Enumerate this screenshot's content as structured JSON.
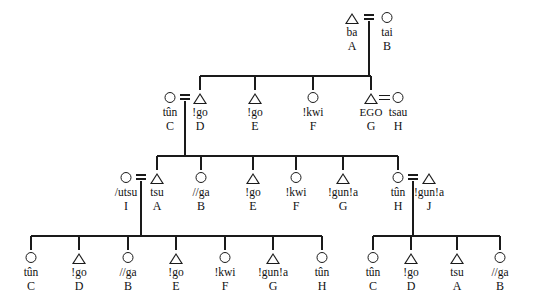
{
  "diagram": {
    "type": "kinship-genealogy",
    "symbols": {
      "male": "triangle",
      "female": "circle"
    },
    "line_color": "#1a1a1a",
    "background": "#ffffff"
  },
  "generations": [
    {
      "id": "gen-1",
      "y_symbol": 12,
      "y_term": 30,
      "y_id": 44,
      "persons": [
        {
          "key": "g1-ba",
          "sex": "male",
          "term": "ba",
          "id": "A",
          "x": 352
        },
        {
          "key": "g1-tai",
          "sex": "female",
          "term": "tai",
          "id": "B",
          "x": 387
        }
      ]
    },
    {
      "id": "gen-2",
      "y_symbol": 92,
      "y_term": 110,
      "y_id": 124,
      "persons": [
        {
          "key": "g2-tun",
          "sex": "female",
          "term": "tûn",
          "id": "C",
          "x": 170
        },
        {
          "key": "g2-go-d",
          "sex": "male",
          "term": "!go",
          "id": "D",
          "x": 200
        },
        {
          "key": "g2-go-e",
          "sex": "male",
          "term": "!go",
          "id": "E",
          "x": 255
        },
        {
          "key": "g2-kwi",
          "sex": "female",
          "term": "!kwi",
          "id": "F",
          "x": 313
        },
        {
          "key": "g2-ego",
          "sex": "male",
          "term": "EGO",
          "id": "G",
          "x": 371
        },
        {
          "key": "g2-tsau",
          "sex": "female",
          "term": "tsau",
          "id": "H",
          "x": 398
        }
      ]
    },
    {
      "id": "gen-3",
      "y_symbol": 172,
      "y_term": 190,
      "y_id": 204,
      "persons": [
        {
          "key": "g3-utsu",
          "sex": "female",
          "term": "/utsu",
          "id": "I",
          "x": 126
        },
        {
          "key": "g3-tsu",
          "sex": "male",
          "term": "tsu",
          "id": "A",
          "x": 157
        },
        {
          "key": "g3-ga",
          "sex": "female",
          "term": "//ga",
          "id": "B",
          "x": 201
        },
        {
          "key": "g3-go",
          "sex": "male",
          "term": "!go",
          "id": "E",
          "x": 253
        },
        {
          "key": "g3-kwi",
          "sex": "female",
          "term": "!kwi",
          "id": "F",
          "x": 296
        },
        {
          "key": "g3-gunla",
          "sex": "male",
          "term": "!gun!a",
          "id": "G",
          "x": 343
        },
        {
          "key": "g3-tun",
          "sex": "female",
          "term": "tûn",
          "id": "H",
          "x": 398
        },
        {
          "key": "g3-gunlaj",
          "sex": "male",
          "term": "!gun!a",
          "id": "J",
          "x": 429
        }
      ]
    },
    {
      "id": "gen-4",
      "y_symbol": 252,
      "y_term": 270,
      "y_id": 284,
      "persons": [
        {
          "key": "g4-tun-c",
          "sex": "female",
          "term": "tûn",
          "id": "C",
          "x": 31
        },
        {
          "key": "g4-go-d",
          "sex": "male",
          "term": "!go",
          "id": "D",
          "x": 79
        },
        {
          "key": "g4-ga-b",
          "sex": "female",
          "term": "//ga",
          "id": "B",
          "x": 128
        },
        {
          "key": "g4-go-e",
          "sex": "male",
          "term": "!go",
          "id": "E",
          "x": 176
        },
        {
          "key": "g4-kwi-f",
          "sex": "female",
          "term": "!kwi",
          "id": "F",
          "x": 225
        },
        {
          "key": "g4-gunla-g",
          "sex": "male",
          "term": "!gun!a",
          "id": "G",
          "x": 273
        },
        {
          "key": "g4-tun-h",
          "sex": "female",
          "term": "tûn",
          "id": "H",
          "x": 322
        },
        {
          "key": "g4-tun-c2",
          "sex": "female",
          "term": "tûn",
          "id": "C",
          "x": 373
        },
        {
          "key": "g4-go-d2",
          "sex": "male",
          "term": "!go",
          "id": "D",
          "x": 411
        },
        {
          "key": "g4-tsu-a",
          "sex": "male",
          "term": "tsu",
          "id": "A",
          "x": 457
        },
        {
          "key": "g4-ga-b2",
          "sex": "female",
          "term": "//ga",
          "id": "B",
          "x": 500
        }
      ]
    }
  ],
  "marriages": [
    {
      "key": "m-g1",
      "style": "double-tick",
      "x": 369,
      "y": 12,
      "left": 352,
      "right": 387,
      "has_descent": true
    },
    {
      "key": "m-g2-cd",
      "style": "double-tick",
      "x": 185,
      "y": 92,
      "left": 170,
      "right": 200,
      "has_descent": true
    },
    {
      "key": "m-g2-ego",
      "style": "equals",
      "x": 385,
      "y": 92,
      "left": 371,
      "right": 398,
      "has_descent": false
    },
    {
      "key": "m-g3-ia",
      "style": "double-tick",
      "x": 141,
      "y": 172,
      "left": 126,
      "right": 157,
      "has_descent": true
    },
    {
      "key": "m-g3-hj",
      "style": "double-tick",
      "x": 413,
      "y": 172,
      "left": 398,
      "right": 429,
      "has_descent": true
    }
  ],
  "sibling_bars": [
    {
      "key": "sib-gen2",
      "y": 76,
      "from_x": 200,
      "to_x": 371,
      "descent_from_x": 369,
      "children_x": [
        200,
        255,
        313,
        371
      ]
    },
    {
      "key": "sib-gen3",
      "y": 156,
      "from_x": 157,
      "to_x": 398,
      "descent_from_x": 185,
      "children_x": [
        157,
        201,
        253,
        296,
        343,
        398
      ]
    },
    {
      "key": "sib-gen4-left",
      "y": 236,
      "from_x": 31,
      "to_x": 322,
      "descent_from_x": 141,
      "children_x": [
        31,
        79,
        128,
        176,
        225,
        273,
        322
      ]
    },
    {
      "key": "sib-gen4-right",
      "y": 236,
      "from_x": 373,
      "to_x": 500,
      "descent_from_x": 413,
      "children_x": [
        373,
        411,
        457,
        500
      ]
    }
  ]
}
